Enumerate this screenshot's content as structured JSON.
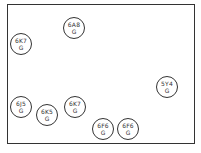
{
  "diagram": {
    "kind": "tube-layout",
    "tubes": [
      {
        "type": "6A8",
        "suffix": "G",
        "x": 63,
        "y": 17
      },
      {
        "type": "6K7",
        "suffix": "G",
        "x": 10,
        "y": 33
      },
      {
        "type": "5Y4",
        "suffix": "G",
        "x": 156,
        "y": 76
      },
      {
        "type": "6J5",
        "suffix": "G",
        "x": 10,
        "y": 96
      },
      {
        "type": "6K5",
        "suffix": "G",
        "x": 36,
        "y": 104
      },
      {
        "type": "6K7",
        "suffix": "G",
        "x": 64,
        "y": 96
      },
      {
        "type": "6F6",
        "suffix": "G",
        "x": 92,
        "y": 118
      },
      {
        "type": "6F6",
        "suffix": "G",
        "x": 117,
        "y": 118
      }
    ]
  }
}
